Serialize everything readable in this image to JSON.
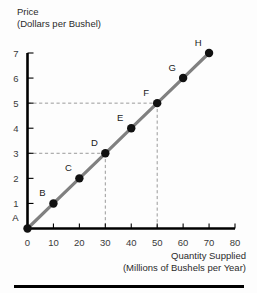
{
  "chart_data": {
    "type": "line",
    "title": "",
    "xlabel": "Quantity Supplied (Millions of Bushels per Year)",
    "ylabel": "Price (Dollars per Bushel)",
    "xlabel_line1": "Quantity Supplied",
    "xlabel_line2": "(Millions of Bushels per Year)",
    "ylabel_line1": "Price",
    "ylabel_line2": "(Dollars per Bushel)",
    "xlim": [
      0,
      80
    ],
    "ylim": [
      0,
      7
    ],
    "xticks": [
      0,
      10,
      20,
      30,
      40,
      50,
      60,
      70,
      80
    ],
    "yticks": [
      1,
      2,
      3,
      4,
      5,
      6,
      7
    ],
    "xtick_labels": [
      "0",
      "10",
      "20",
      "30",
      "40",
      "50",
      "60",
      "70",
      "80"
    ],
    "ytick_labels": [
      "1",
      "2",
      "3",
      "4",
      "5",
      "6",
      "7"
    ],
    "grid": false,
    "legend": "none",
    "series": [
      {
        "name": "Supply",
        "color": "#808080",
        "points": [
          {
            "label": "A",
            "x": 0,
            "y": 0
          },
          {
            "label": "B",
            "x": 10,
            "y": 1
          },
          {
            "label": "C",
            "x": 20,
            "y": 2
          },
          {
            "label": "D",
            "x": 30,
            "y": 3
          },
          {
            "label": "E",
            "x": 40,
            "y": 4
          },
          {
            "label": "F",
            "x": 50,
            "y": 5
          },
          {
            "label": "G",
            "x": 60,
            "y": 6
          },
          {
            "label": "H",
            "x": 70,
            "y": 7
          }
        ]
      }
    ],
    "annotations": [
      {
        "name": "guide-d",
        "type": "dashed-guide",
        "x": 30,
        "y": 3,
        "color": "#9a9a9a"
      },
      {
        "name": "guide-f",
        "type": "dashed-guide",
        "x": 50,
        "y": 5,
        "color": "#9a9a9a"
      }
    ],
    "origin_label": "A"
  },
  "colors": {
    "line": "#808080",
    "dot": "#111111",
    "axis": "#000000",
    "guide": "#9a9a9a",
    "background": "#fdfdfd"
  }
}
